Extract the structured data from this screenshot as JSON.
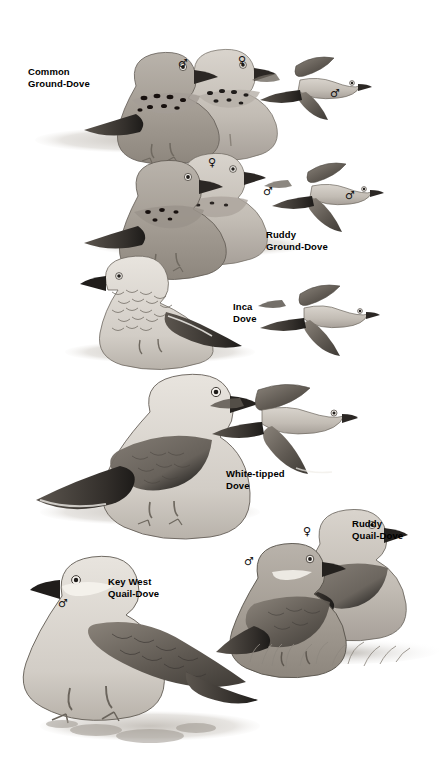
{
  "page": {
    "type": "field-guide-plate",
    "background_color": "#ffffff",
    "ink_color": "#000000",
    "style": "grayscale watercolor plate",
    "width": 442,
    "height": 765
  },
  "symbols": {
    "male": "♂",
    "female": "♀"
  },
  "species": [
    {
      "id": "common-ground-dove",
      "label": "Common\nGround-Dove",
      "label_x": 28,
      "label_y": 66,
      "perched": [
        {
          "sex": "male",
          "sex_x": 178,
          "sex_y": 58
        },
        {
          "sex": "female",
          "sex_x": 238,
          "sex_y": 55
        }
      ],
      "flight": [
        {
          "sex": "male",
          "sex_x": 330,
          "sex_y": 88
        }
      ]
    },
    {
      "id": "ruddy-ground-dove",
      "label": "Ruddy\nGround-Dove",
      "label_x": 266,
      "label_y": 229,
      "perched": [
        {
          "sex": "female",
          "sex_x": 208,
          "sex_y": 157
        },
        {
          "sex": "male",
          "sex_x": 263,
          "sex_y": 186
        }
      ],
      "flight": [
        {
          "sex": "male",
          "sex_x": 345,
          "sex_y": 190
        }
      ]
    },
    {
      "id": "inca-dove",
      "label": "Inca\nDove",
      "label_x": 233,
      "label_y": 301,
      "perched": [
        {
          "sex": null
        }
      ],
      "flight": [
        {
          "sex": null
        }
      ]
    },
    {
      "id": "white-tipped-dove",
      "label": "White-tipped\nDove",
      "label_x": 226,
      "label_y": 468,
      "perched": [
        {
          "sex": null
        }
      ],
      "flight": [
        {
          "sex": null
        }
      ]
    },
    {
      "id": "ruddy-quail-dove",
      "label": "Ruddy\nQuail-Dove",
      "label_x": 352,
      "label_y": 518,
      "perched": [
        {
          "sex": "male",
          "sex_x": 244,
          "sex_y": 556
        },
        {
          "sex": "female",
          "sex_x": 303,
          "sex_y": 526
        }
      ],
      "flight": []
    },
    {
      "id": "key-west-quail-dove",
      "label": "Key West\nQuail-Dove",
      "label_x": 108,
      "label_y": 576,
      "perched": [
        {
          "sex": "male",
          "sex_x": 58,
          "sex_y": 598
        }
      ],
      "flight": []
    }
  ]
}
